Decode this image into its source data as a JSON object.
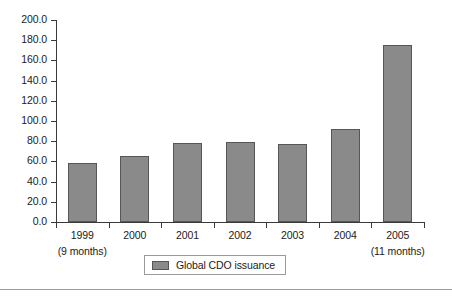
{
  "chart_data": {
    "type": "bar",
    "title": "",
    "subtitle": "",
    "xlabel": "",
    "ylabel": "",
    "categories": [
      "1999",
      "2000",
      "2001",
      "2002",
      "2003",
      "2004",
      "2005"
    ],
    "category_sublabels": [
      "(9 months)",
      "",
      "",
      "",
      "",
      "",
      "(11 months)"
    ],
    "values": [
      58.0,
      65.0,
      78.0,
      79.5,
      77.0,
      92.5,
      175.0
    ],
    "series": [
      {
        "name": "Global CDO issuance",
        "values": [
          58.0,
          65.0,
          78.0,
          79.5,
          77.0,
          92.5,
          175.0
        ],
        "color": "#8a8a8a"
      }
    ],
    "ylim": [
      0,
      200
    ],
    "ytick_step": 20,
    "ytick_labels": [
      "0.0",
      "20.0",
      "40.0",
      "60.0",
      "80.0",
      "100.0",
      "120.0",
      "140.0",
      "160.0",
      "180.0",
      "200.0"
    ],
    "ytick_values": [
      0,
      20,
      40,
      60,
      80,
      100,
      120,
      140,
      160,
      180,
      200
    ],
    "grid": false,
    "legend": {
      "position": "bottom-center",
      "entries": [
        {
          "label": "Global CDO issuance",
          "color": "#8a8a8a"
        }
      ]
    }
  },
  "legend": {
    "label": "Global CDO issuance"
  },
  "colors": {
    "bar_fill": "#8a8a8a",
    "bar_border": "#55555a",
    "axis": "#3a3a3a",
    "text": "#1b1b1b",
    "background": "#ffffff",
    "footer_rule": "#9d9d9d"
  }
}
